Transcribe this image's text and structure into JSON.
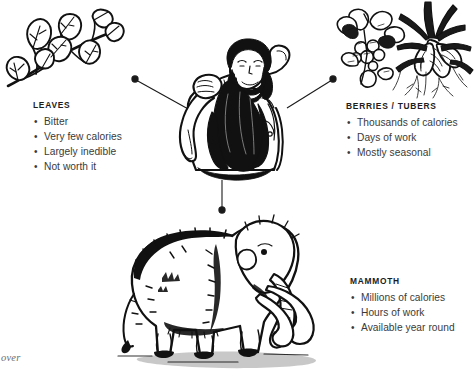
{
  "meta": {
    "background_color": "#ffffff",
    "ink_color": "#111111",
    "heading_color": "#1c1c1c",
    "body_text_color": "#3a3a3a",
    "caption_color": "#6d6d6d"
  },
  "corner_caption": "over",
  "center": {
    "subject_name": "caveman-with-club",
    "description": "bearded long-haired caveman carrying a club over his shoulder"
  },
  "connectors": [
    {
      "name": "connector-to-leaves",
      "from": "center-left",
      "to": "leaves",
      "dot_end": "outer",
      "style": "line-with-dot"
    },
    {
      "name": "connector-to-berries",
      "from": "center-right",
      "to": "berries-tubers",
      "dot_end": "outer",
      "style": "line-with-dot"
    },
    {
      "name": "connector-to-mammoth",
      "from": "center-bottom",
      "to": "mammoth",
      "dot_end": "outer",
      "style": "line-with-dot"
    }
  ],
  "blocks": [
    {
      "id": "leaves",
      "title": "LEAVES",
      "illustration": "leafy-branch-icon",
      "bullets": [
        "Bitter",
        "Very few calories",
        "Largely inedible",
        "Not worth it"
      ]
    },
    {
      "id": "berries_tubers",
      "title": "BERRIES / TUBERS",
      "illustration": "berry-cluster-icon",
      "illustration_secondary": "root-tuber-icon",
      "bullets": [
        "Thousands of calories",
        "Days of work",
        "Mostly seasonal"
      ]
    },
    {
      "id": "mammoth",
      "title": "MAMMOTH",
      "illustration": "woolly-mammoth-icon",
      "bullets": [
        "Millions of calories",
        "Hours of work",
        "Available year round"
      ]
    }
  ]
}
